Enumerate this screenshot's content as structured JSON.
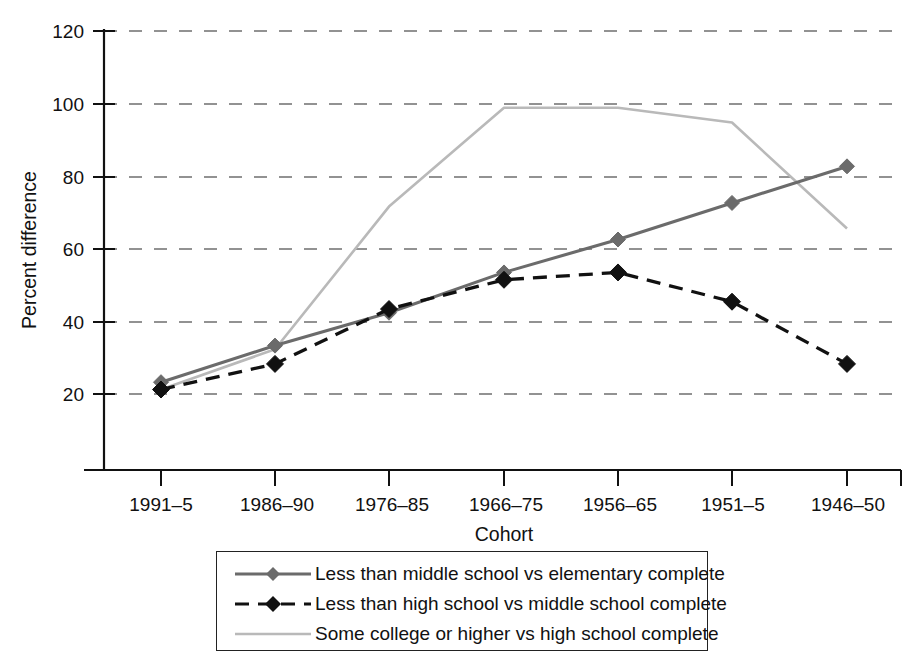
{
  "chart_data": {
    "type": "line",
    "title": "",
    "xlabel": "Cohort",
    "ylabel": "Percent difference",
    "categories": [
      "1991–5",
      "1986–90",
      "1976–85",
      "1966–75",
      "1956–65",
      "1951–5",
      "1946–50"
    ],
    "ylim": [
      0,
      120
    ],
    "yticks": [
      0,
      20,
      40,
      60,
      80,
      100,
      120
    ],
    "ytick_labels": [
      "",
      "20",
      "40",
      "60",
      "80",
      "100",
      "120"
    ],
    "grid": "horizontal-dashed",
    "legend_position": "below-plot",
    "series": [
      {
        "name": "Less than middle school vs elementary complete",
        "color": "#6b6b6b",
        "style": "solid",
        "marker": "diamond",
        "values": [
          24,
          34,
          43,
          54,
          63,
          73,
          83
        ]
      },
      {
        "name": "Less than high school vs middle school complete",
        "color": "#111111",
        "style": "dashed",
        "marker": "diamond",
        "values": [
          22,
          29,
          44,
          52,
          54,
          46,
          29
        ]
      },
      {
        "name": "Some college or higher vs high school complete",
        "color": "#b9b9b9",
        "style": "solid",
        "marker": "none",
        "values": [
          22,
          33,
          72,
          99,
          99,
          95,
          66
        ]
      }
    ]
  },
  "axes": {
    "y_title": "Percent difference",
    "x_title": "Cohort",
    "y_tick_120": "120",
    "y_tick_100": "100",
    "y_tick_80": "80",
    "y_tick_60": "60",
    "y_tick_40": "40",
    "y_tick_20": "20",
    "y_tick_0": "",
    "x_tick_0": "1991–5",
    "x_tick_1": "1986–90",
    "x_tick_2": "1976–85",
    "x_tick_3": "1966–75",
    "x_tick_4": "1956–65",
    "x_tick_5": "1951–5",
    "x_tick_6": "1946–50"
  },
  "legend": {
    "items": [
      {
        "label": "Less than middle school vs elementary complete"
      },
      {
        "label": "Less than high school vs middle school complete"
      },
      {
        "label": "Some college or higher vs high school complete"
      }
    ]
  }
}
